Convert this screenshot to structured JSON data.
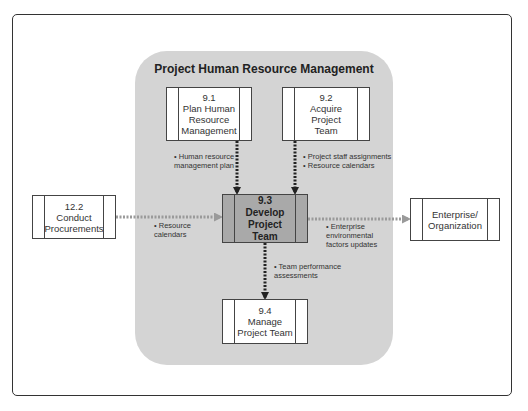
{
  "panel": {
    "title": "Project Human Resource Management"
  },
  "processes": [
    {
      "id": "9.1",
      "label": "9.1\nPlan Human\nResource\nManagement"
    },
    {
      "id": "9.2",
      "label": "9.2\nAcquire Project\nTeam"
    },
    {
      "id": "9.3",
      "label": "9.3\nDevelop\nProject Team"
    },
    {
      "id": "9.4",
      "label": "9.4\nManage\nProject Team"
    },
    {
      "id": "12.2",
      "label": "12.2\nConduct\nProcurements"
    },
    {
      "id": "ent",
      "label": "Enterprise/\nOrganization"
    }
  ],
  "flows": [
    {
      "from": "9.1",
      "to": "9.3",
      "label": "• Human resource\n  management plan"
    },
    {
      "from": "9.2",
      "to": "9.3",
      "label": "• Project staff assignments\n• Resource calendars"
    },
    {
      "from": "12.2",
      "to": "9.3",
      "label": "• Resource\n  calendars"
    },
    {
      "from": "9.3",
      "to": "ent",
      "label": "• Enterprise\n  environmental\n  factors updates"
    },
    {
      "from": "9.3",
      "to": "9.4",
      "label": "• Team performance\n  assessments"
    }
  ],
  "colors": {
    "panel": "#d4d4d4",
    "center_process": "#a9a9a9",
    "internal_arrow": "#222222",
    "external_arrow": "#9a9a9a"
  }
}
